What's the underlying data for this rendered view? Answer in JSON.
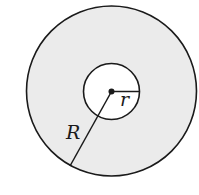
{
  "diagram": {
    "type": "annulus",
    "outer_circle": {
      "cx": 111.5,
      "cy": 91,
      "r": 85,
      "fill": "#ebebeb",
      "stroke": "#1a1a1a"
    },
    "inner_circle": {
      "cx": 111.5,
      "cy": 91.5,
      "r": 28,
      "fill": "#ffffff",
      "stroke": "#1a1a1a"
    },
    "center_point": {
      "cx": 111.5,
      "cy": 91.5
    },
    "labels": {
      "outer_radius": "R",
      "inner_radius": "r"
    }
  }
}
